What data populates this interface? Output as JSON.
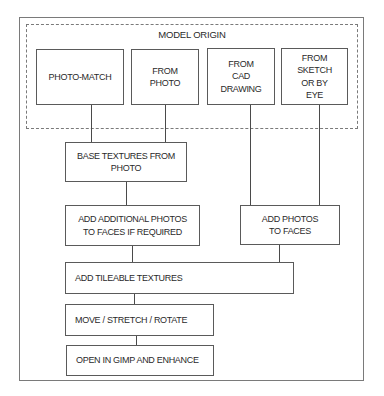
{
  "diagram": {
    "group": {
      "title": "MODEL ORIGIN"
    },
    "origin_boxes": [
      {
        "id": "photo-match",
        "label": "PHOTO-MATCH"
      },
      {
        "id": "from-photo",
        "label": "FROM\nPHOTO"
      },
      {
        "id": "from-cad",
        "label": "FROM\nCAD\nDRAWING"
      },
      {
        "id": "from-sketch",
        "label": "FROM\nSKETCH\nOR BY\nEYE"
      }
    ],
    "steps": {
      "base_textures": "BASE TEXTURES FROM\nPHOTO",
      "add_additional_photos": "ADD ADDITIONAL PHOTOS\nTO FACES IF REQUIRED",
      "add_photos_to_faces": "ADD PHOTOS\nTO FACES",
      "add_tileable_textures": "ADD TILEABLE TEXTURES",
      "move_stretch_rotate": "MOVE / STRETCH / ROTATE",
      "open_in_gimp": "OPEN IN GIMP AND ENHANCE"
    },
    "edges": [
      [
        "PHOTO-MATCH",
        "BASE TEXTURES FROM PHOTO"
      ],
      [
        "FROM PHOTO",
        "BASE TEXTURES FROM PHOTO"
      ],
      [
        "FROM CAD DRAWING",
        "ADD PHOTOS TO FACES"
      ],
      [
        "FROM SKETCH OR BY EYE",
        "ADD PHOTOS TO FACES"
      ],
      [
        "BASE TEXTURES FROM PHOTO",
        "ADD ADDITIONAL PHOTOS TO FACES IF REQUIRED"
      ],
      [
        "ADD ADDITIONAL PHOTOS TO FACES IF REQUIRED",
        "ADD TILEABLE TEXTURES"
      ],
      [
        "ADD PHOTOS TO FACES",
        "ADD TILEABLE TEXTURES"
      ],
      [
        "ADD TILEABLE TEXTURES",
        "MOVE / STRETCH / ROTATE"
      ],
      [
        "MOVE / STRETCH / ROTATE",
        "OPEN IN GIMP AND ENHANCE"
      ]
    ]
  }
}
